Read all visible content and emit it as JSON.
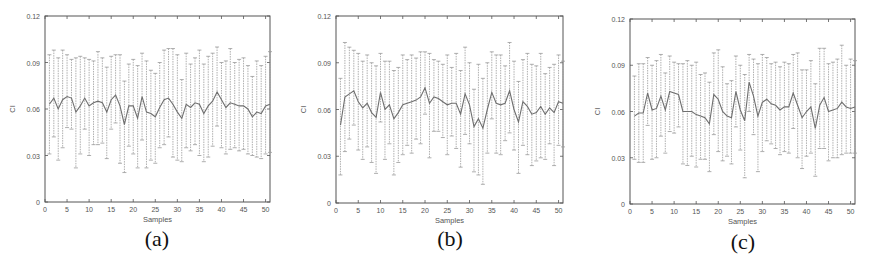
{
  "figure": {
    "panels": [
      {
        "id": "a",
        "label": "(a)"
      },
      {
        "id": "b",
        "label": "(b)"
      },
      {
        "id": "c",
        "label": "(c)"
      }
    ]
  },
  "colors": {
    "axis": "#555555",
    "mean_line": "#6f6f6f",
    "error_bar": "#9a9a9a",
    "tick_text": "#555555",
    "background": "#ffffff"
  },
  "chart_data": [
    {
      "type": "line",
      "panel": "(a)",
      "title": "",
      "xlabel": "Samples",
      "ylabel": "CI",
      "xlim": [
        0,
        51
      ],
      "ylim": [
        0,
        0.12
      ],
      "xticks": [
        0,
        5,
        10,
        15,
        20,
        25,
        30,
        35,
        40,
        45,
        50
      ],
      "yticks": [
        0,
        0.03,
        0.06,
        0.09,
        0.12
      ],
      "ytick_labels": [
        "0",
        "0.03",
        "0.06",
        "0.09",
        "0.12"
      ],
      "grid": false,
      "error_bars": true,
      "x": [
        1,
        2,
        3,
        4,
        5,
        6,
        7,
        8,
        9,
        10,
        11,
        12,
        13,
        14,
        15,
        16,
        17,
        18,
        19,
        20,
        21,
        22,
        23,
        24,
        25,
        26,
        27,
        28,
        29,
        30,
        31,
        32,
        33,
        34,
        35,
        36,
        37,
        38,
        39,
        40,
        41,
        42,
        43,
        44,
        45,
        46,
        47,
        48,
        49,
        50,
        51
      ],
      "mean": [
        0.063,
        0.067,
        0.06,
        0.066,
        0.068,
        0.067,
        0.058,
        0.062,
        0.067,
        0.062,
        0.064,
        0.065,
        0.064,
        0.058,
        0.066,
        0.069,
        0.062,
        0.05,
        0.062,
        0.062,
        0.054,
        0.068,
        0.058,
        0.057,
        0.055,
        0.061,
        0.066,
        0.067,
        0.063,
        0.058,
        0.054,
        0.063,
        0.061,
        0.064,
        0.063,
        0.057,
        0.062,
        0.065,
        0.071,
        0.066,
        0.061,
        0.064,
        0.063,
        0.062,
        0.062,
        0.06,
        0.055,
        0.058,
        0.057,
        0.062,
        0.063
      ],
      "upper": [
        0.095,
        0.098,
        0.093,
        0.098,
        0.095,
        0.092,
        0.093,
        0.094,
        0.093,
        0.092,
        0.091,
        0.097,
        0.093,
        0.087,
        0.094,
        0.095,
        0.095,
        0.078,
        0.089,
        0.092,
        0.088,
        0.096,
        0.091,
        0.085,
        0.083,
        0.09,
        0.098,
        0.099,
        0.099,
        0.095,
        0.079,
        0.096,
        0.089,
        0.093,
        0.098,
        0.089,
        0.094,
        0.096,
        0.1,
        0.09,
        0.091,
        0.099,
        0.09,
        0.092,
        0.093,
        0.088,
        0.081,
        0.091,
        0.088,
        0.094,
        0.097
      ],
      "lower": [
        0.031,
        0.042,
        0.027,
        0.035,
        0.048,
        0.047,
        0.022,
        0.031,
        0.047,
        0.03,
        0.037,
        0.037,
        0.038,
        0.028,
        0.047,
        0.051,
        0.025,
        0.019,
        0.036,
        0.031,
        0.022,
        0.04,
        0.022,
        0.027,
        0.025,
        0.035,
        0.037,
        0.042,
        0.029,
        0.027,
        0.026,
        0.035,
        0.033,
        0.037,
        0.03,
        0.026,
        0.029,
        0.036,
        0.049,
        0.035,
        0.031,
        0.034,
        0.035,
        0.033,
        0.034,
        0.031,
        0.03,
        0.029,
        0.028,
        0.031,
        0.032
      ]
    },
    {
      "type": "line",
      "panel": "(b)",
      "title": "",
      "xlabel": "Samples",
      "ylabel": "CI",
      "xlim": [
        0,
        51
      ],
      "ylim": [
        0,
        0.12
      ],
      "xticks": [
        0,
        5,
        10,
        15,
        20,
        25,
        30,
        35,
        40,
        45,
        50
      ],
      "yticks": [
        0,
        0.03,
        0.06,
        0.09,
        0.12
      ],
      "ytick_labels": [
        "0",
        "0.03",
        "0.06",
        "0.09",
        "0.12"
      ],
      "grid": false,
      "error_bars": true,
      "x": [
        1,
        2,
        3,
        4,
        5,
        6,
        7,
        8,
        9,
        10,
        11,
        12,
        13,
        14,
        15,
        16,
        17,
        18,
        19,
        20,
        21,
        22,
        23,
        24,
        25,
        26,
        27,
        28,
        29,
        30,
        31,
        32,
        33,
        34,
        35,
        36,
        37,
        38,
        39,
        40,
        41,
        42,
        43,
        44,
        45,
        46,
        47,
        48,
        49,
        50,
        51
      ],
      "mean": [
        0.05,
        0.068,
        0.07,
        0.072,
        0.065,
        0.061,
        0.064,
        0.058,
        0.055,
        0.071,
        0.06,
        0.063,
        0.054,
        0.058,
        0.063,
        0.064,
        0.065,
        0.066,
        0.068,
        0.074,
        0.064,
        0.068,
        0.067,
        0.065,
        0.063,
        0.064,
        0.064,
        0.057,
        0.07,
        0.063,
        0.049,
        0.054,
        0.048,
        0.06,
        0.071,
        0.064,
        0.063,
        0.064,
        0.072,
        0.06,
        0.052,
        0.065,
        0.062,
        0.057,
        0.058,
        0.062,
        0.057,
        0.061,
        0.058,
        0.065,
        0.064
      ],
      "upper": [
        0.08,
        0.103,
        0.1,
        0.098,
        0.096,
        0.091,
        0.095,
        0.09,
        0.088,
        0.096,
        0.091,
        0.091,
        0.085,
        0.087,
        0.095,
        0.092,
        0.095,
        0.093,
        0.097,
        0.097,
        0.096,
        0.092,
        0.091,
        0.089,
        0.095,
        0.087,
        0.096,
        0.085,
        0.1,
        0.09,
        0.073,
        0.089,
        0.08,
        0.09,
        0.097,
        0.095,
        0.095,
        0.088,
        0.103,
        0.091,
        0.078,
        0.092,
        0.096,
        0.089,
        0.088,
        0.096,
        0.083,
        0.087,
        0.089,
        0.095,
        0.091
      ],
      "lower": [
        0.018,
        0.033,
        0.041,
        0.05,
        0.034,
        0.028,
        0.036,
        0.026,
        0.019,
        0.052,
        0.028,
        0.038,
        0.018,
        0.026,
        0.031,
        0.037,
        0.032,
        0.041,
        0.038,
        0.057,
        0.029,
        0.046,
        0.046,
        0.042,
        0.031,
        0.043,
        0.035,
        0.023,
        0.044,
        0.038,
        0.02,
        0.018,
        0.012,
        0.032,
        0.054,
        0.032,
        0.031,
        0.04,
        0.045,
        0.034,
        0.019,
        0.037,
        0.031,
        0.024,
        0.027,
        0.029,
        0.028,
        0.038,
        0.024,
        0.037,
        0.036
      ]
    },
    {
      "type": "line",
      "panel": "(c)",
      "title": "",
      "xlabel": "Samples",
      "ylabel": "CI",
      "xlim": [
        0,
        51
      ],
      "ylim": [
        0,
        0.12
      ],
      "xticks": [
        0,
        5,
        10,
        15,
        20,
        25,
        30,
        35,
        40,
        45,
        50
      ],
      "yticks": [
        0,
        0.03,
        0.06,
        0.09,
        0.12
      ],
      "ytick_labels": [
        "0",
        "0.03",
        "0.06",
        "0.09",
        "0.12"
      ],
      "grid": false,
      "error_bars": true,
      "x": [
        1,
        2,
        3,
        4,
        5,
        6,
        7,
        8,
        9,
        10,
        11,
        12,
        13,
        14,
        15,
        16,
        17,
        18,
        19,
        20,
        21,
        22,
        23,
        24,
        25,
        26,
        27,
        28,
        29,
        30,
        31,
        32,
        33,
        34,
        35,
        36,
        37,
        38,
        39,
        40,
        41,
        42,
        43,
        44,
        45,
        46,
        47,
        48,
        49,
        50,
        51
      ],
      "mean": [
        0.057,
        0.059,
        0.059,
        0.072,
        0.061,
        0.062,
        0.07,
        0.061,
        0.073,
        0.072,
        0.071,
        0.06,
        0.06,
        0.06,
        0.058,
        0.057,
        0.056,
        0.052,
        0.071,
        0.068,
        0.06,
        0.057,
        0.056,
        0.073,
        0.061,
        0.054,
        0.079,
        0.07,
        0.057,
        0.066,
        0.068,
        0.065,
        0.064,
        0.061,
        0.063,
        0.063,
        0.072,
        0.064,
        0.056,
        0.06,
        0.063,
        0.049,
        0.064,
        0.069,
        0.06,
        0.061,
        0.062,
        0.066,
        0.063,
        0.062,
        0.063
      ],
      "upper": [
        0.083,
        0.091,
        0.091,
        0.095,
        0.09,
        0.093,
        0.097,
        0.085,
        0.096,
        0.092,
        0.091,
        0.091,
        0.093,
        0.09,
        0.092,
        0.084,
        0.085,
        0.079,
        0.098,
        0.1,
        0.089,
        0.078,
        0.08,
        0.096,
        0.09,
        0.084,
        0.097,
        0.094,
        0.091,
        0.097,
        0.095,
        0.091,
        0.092,
        0.089,
        0.092,
        0.091,
        0.097,
        0.098,
        0.087,
        0.087,
        0.093,
        0.078,
        0.101,
        0.101,
        0.091,
        0.092,
        0.094,
        0.103,
        0.09,
        0.094,
        0.093
      ],
      "lower": [
        0.029,
        0.027,
        0.027,
        0.051,
        0.029,
        0.03,
        0.044,
        0.033,
        0.047,
        0.046,
        0.05,
        0.026,
        0.025,
        0.031,
        0.024,
        0.029,
        0.029,
        0.021,
        0.045,
        0.034,
        0.028,
        0.031,
        0.026,
        0.05,
        0.035,
        0.017,
        0.06,
        0.045,
        0.021,
        0.034,
        0.041,
        0.039,
        0.036,
        0.032,
        0.034,
        0.033,
        0.049,
        0.03,
        0.023,
        0.031,
        0.033,
        0.018,
        0.036,
        0.036,
        0.028,
        0.03,
        0.03,
        0.032,
        0.033,
        0.033,
        0.033
      ]
    }
  ]
}
